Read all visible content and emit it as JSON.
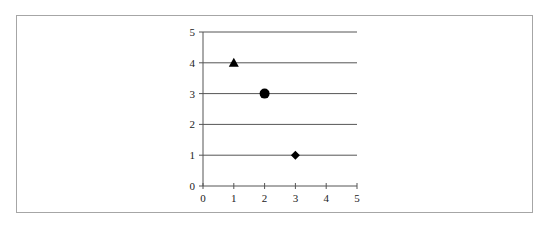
{
  "chart_data": {
    "type": "scatter",
    "title": "",
    "xlabel": "",
    "ylabel": "",
    "xlim": [
      0,
      5
    ],
    "ylim": [
      0,
      5
    ],
    "grid": "horizontal",
    "legend": null,
    "x_ticks": [
      "0",
      "1",
      "2",
      "3",
      "4",
      "5"
    ],
    "y_ticks": [
      "0",
      "1",
      "2",
      "3",
      "4",
      "5"
    ],
    "points": [
      {
        "x": 1,
        "y": 4,
        "marker": "triangle"
      },
      {
        "x": 2,
        "y": 3,
        "marker": "circle"
      },
      {
        "x": 3,
        "y": 1,
        "marker": "diamond"
      }
    ]
  },
  "colors": {
    "marker": "#000000",
    "gridline": "#555555",
    "axis": "#555555",
    "frame": "#a6a6a6"
  }
}
